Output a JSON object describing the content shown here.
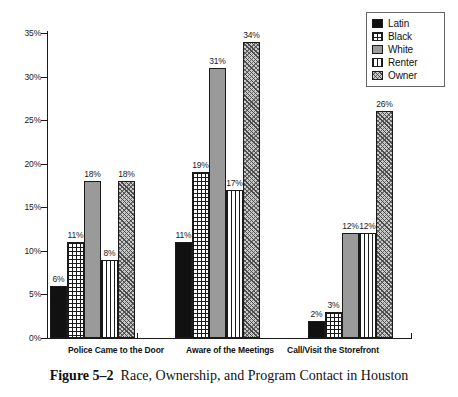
{
  "caption": {
    "figure_number": "Figure 5–2",
    "text": "Race, Ownership, and Program Contact in Houston"
  },
  "legend": {
    "items": [
      {
        "label": "Latin",
        "pattern": "solid-black",
        "color": "#111111"
      },
      {
        "label": "Black",
        "pattern": "grid-crosshatch",
        "color": "#1a1a1a"
      },
      {
        "label": "White",
        "pattern": "solid-gray",
        "color": "#9a9a9a"
      },
      {
        "label": "Renter",
        "pattern": "vertical-lines",
        "color": "#1a1a1a"
      },
      {
        "label": "Owner",
        "pattern": "diagonal-hatch",
        "color": "#c9c9c9"
      }
    ]
  },
  "axis": {
    "y_ticks": [
      "0%",
      "5%",
      "10%",
      "15%",
      "20%",
      "25%",
      "30%",
      "35%"
    ]
  },
  "chart_data": {
    "type": "bar",
    "title": "Race, Ownership, and Program Contact in Houston",
    "xlabel": "",
    "ylabel": "",
    "ylim": [
      0,
      35
    ],
    "ytick_values": [
      0,
      5,
      10,
      15,
      20,
      25,
      30,
      35
    ],
    "ytick_labels": [
      "0%",
      "5%",
      "10%",
      "15%",
      "20%",
      "25%",
      "30%",
      "35%"
    ],
    "grid": false,
    "legend_position": "top-right",
    "value_label_suffix": "%",
    "categories": [
      "Police Came to the Door",
      "Aware of the Meetings",
      "Call/Visit the Storefront"
    ],
    "series": [
      {
        "name": "Latin",
        "values": [
          6,
          11,
          2
        ],
        "labels": [
          "6%",
          "11%",
          "2%"
        ]
      },
      {
        "name": "Black",
        "values": [
          11,
          19,
          3
        ],
        "labels": [
          "11%",
          "19%",
          "3%"
        ]
      },
      {
        "name": "White",
        "values": [
          18,
          31,
          12
        ],
        "labels": [
          "18%",
          "31%",
          "12%"
        ]
      },
      {
        "name": "Renter",
        "values": [
          9,
          17,
          12
        ],
        "labels": [
          "8%",
          "17%",
          "12%"
        ]
      },
      {
        "name": "Owner",
        "values": [
          18,
          34,
          26
        ],
        "labels": [
          "18%",
          "34%",
          "26%"
        ]
      }
    ]
  }
}
